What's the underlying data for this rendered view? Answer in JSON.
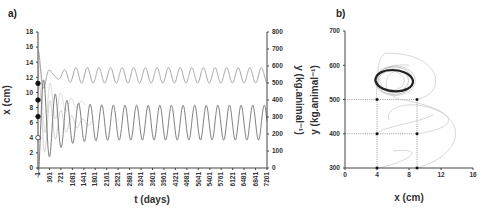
{
  "chart_data": [
    {
      "panel": "a)",
      "type": "line",
      "xlabel": "t (days)",
      "ylabel_left": "x (cm)",
      "ylabel_right": "y (kg.animal⁻¹)",
      "x_ticks": [
        "1",
        "361",
        "721",
        "1081",
        "1441",
        "1801",
        "2161",
        "2521",
        "2881",
        "3241",
        "3601",
        "3961",
        "4321",
        "4681",
        "5041",
        "5401",
        "5761",
        "6121",
        "6481",
        "6841",
        "7201"
      ],
      "xlim": [
        1,
        7201
      ],
      "ylim_left": [
        0,
        18
      ],
      "y_ticks_left": [
        0,
        2,
        4,
        6,
        8,
        10,
        12,
        14,
        16,
        18
      ],
      "ylim_right": [
        0,
        800
      ],
      "y_ticks_right": [
        0,
        100,
        200,
        300,
        400,
        500,
        600,
        700,
        800
      ],
      "series": [
        {
          "name": "y (herbivore, right axis)",
          "axis": "right",
          "color": "#9a9a9a",
          "steady_min": 500,
          "steady_max": 590,
          "period_days": 365,
          "transient": "damped large oscillation from 1 to ~1500"
        },
        {
          "name": "x (vegetation, left axis)",
          "axis": "left",
          "color": "#6e6e6e",
          "steady_min": 3.7,
          "steady_max": 8.3,
          "period_days": 365,
          "transient": "peaks up to ~15.5 before ~1100"
        },
        {
          "name": "transient trajectories",
          "axis": "left",
          "color": "#c8c8c8",
          "note": "faint initial-condition runs decaying into cycle"
        }
      ],
      "initial_points_left_axis": [
        {
          "x": 11.2,
          "marker": "filled"
        },
        {
          "x": 9.0,
          "marker": "filled"
        },
        {
          "x": 6.8,
          "marker": "filled"
        },
        {
          "x": 4.0,
          "marker": "open"
        }
      ]
    },
    {
      "panel": "b)",
      "type": "scatter",
      "subtype": "phase-plane",
      "xlabel": "x (cm)",
      "ylabel": "y (kg.animal⁻¹)",
      "xlim": [
        0,
        16
      ],
      "x_ticks": [
        0,
        4,
        8,
        12,
        16
      ],
      "ylim": [
        300,
        700
      ],
      "y_ticks": [
        300,
        400,
        500,
        600,
        700
      ],
      "limit_cycle": {
        "x_range": [
          3.8,
          8.5
        ],
        "y_range": [
          515,
          595
        ],
        "color": "#222222"
      },
      "initial_points": [
        {
          "x": 4,
          "y": 500
        },
        {
          "x": 9,
          "y": 500
        },
        {
          "x": 4,
          "y": 400
        },
        {
          "x": 9,
          "y": 400
        },
        {
          "x": 4,
          "y": 300
        },
        {
          "x": 9,
          "y": 300
        }
      ],
      "grid": "dotted reference lines at x=4, x=9, y=400, y=500"
    }
  ]
}
